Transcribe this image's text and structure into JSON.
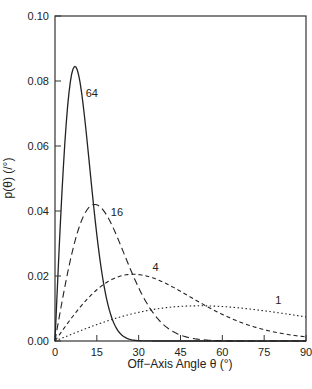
{
  "chart_data": {
    "type": "line",
    "title": "",
    "xlabel": "Off−Axis Angle θ (°)",
    "ylabel": "p(θ) (/°)",
    "xlim": [
      0,
      90
    ],
    "ylim": [
      0,
      0.1
    ],
    "xticks": [
      0,
      15,
      30,
      45,
      60,
      75,
      90
    ],
    "xtick_labels": [
      "0",
      "15",
      "30",
      "45",
      "60",
      "75",
      "90"
    ],
    "yticks": [
      0.0,
      0.02,
      0.04,
      0.06,
      0.08,
      0.1
    ],
    "ytick_labels": [
      "0.00",
      "0.02",
      "0.04",
      "0.06",
      "0.08",
      "0.10"
    ],
    "grid": false,
    "legend": "inline curve labels",
    "x": [
      0,
      5,
      10,
      15,
      20,
      25,
      30,
      35,
      40,
      45,
      50,
      55,
      60,
      65,
      70,
      75,
      80,
      85,
      90
    ],
    "series": [
      {
        "name": "64",
        "style": "solid",
        "peak": {
          "x": 7.2,
          "y": 0.0845
        },
        "label_pos": {
          "x": 11,
          "y": 0.075
        },
        "values": [
          0,
          0.0763,
          0.0733,
          0.0327,
          0.0081,
          0.0012,
          0.0001,
          0,
          0,
          0,
          0,
          0,
          0,
          0,
          0,
          0,
          0,
          0,
          0
        ]
      },
      {
        "name": "16",
        "style": "long-dash",
        "peak": {
          "x": 14.3,
          "y": 0.042
        },
        "label_pos": {
          "x": 20,
          "y": 0.0385
        },
        "values": [
          0,
          0.0229,
          0.038,
          0.0419,
          0.0364,
          0.0264,
          0.0164,
          0.0089,
          0.0043,
          0.0018,
          0.0007,
          0.0003,
          0.0001,
          0,
          0,
          0,
          0,
          0,
          0
        ]
      },
      {
        "name": "4",
        "style": "short-dash",
        "peak": {
          "x": 28.9,
          "y": 0.0206
        },
        "label_pos": {
          "x": 35,
          "y": 0.0215
        },
        "values": [
          0,
          0.006,
          0.0114,
          0.0158,
          0.0188,
          0.0203,
          0.0204,
          0.0194,
          0.0176,
          0.0154,
          0.0128,
          0.0104,
          0.0082,
          0.0063,
          0.0047,
          0.0035,
          0.0025,
          0.0018,
          0.0013
        ]
      },
      {
        "name": "1",
        "style": "dotted",
        "peak": {
          "x": 51.8,
          "y": 0.0108
        },
        "label_pos": {
          "x": 79,
          "y": 0.0115
        },
        "values": [
          0,
          0.0018,
          0.0035,
          0.0051,
          0.0065,
          0.0078,
          0.0088,
          0.0097,
          0.0103,
          0.0107,
          0.0108,
          0.0108,
          0.0106,
          0.0103,
          0.0098,
          0.0093,
          0.0087,
          0.008,
          0.0074
        ]
      }
    ]
  }
}
